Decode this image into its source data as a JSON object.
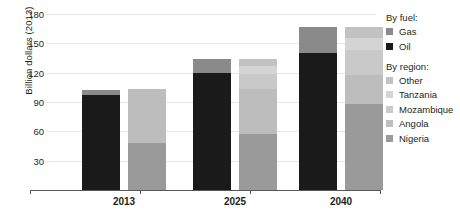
{
  "chart_data": {
    "type": "bar",
    "title": "",
    "subtitle": "",
    "xlabel": "",
    "ylabel": "Billion dollars (2013)",
    "categories": [
      "2013",
      "2025",
      "2040"
    ],
    "ylim": [
      0,
      180
    ],
    "yticks": [
      30,
      60,
      90,
      120,
      150,
      180
    ],
    "grid": true,
    "legend_position": "right",
    "stacked": true,
    "bars_per_category": 2,
    "bar_groups": [
      {
        "name": "By fuel",
        "series": [
          {
            "name": "Oil",
            "color": "#1a1a1a",
            "values": [
              97,
              120,
              140
            ]
          },
          {
            "name": "Gas",
            "color": "#8a8a8a",
            "values": [
              5,
              14,
              27
            ]
          }
        ],
        "totals": [
          102,
          134,
          167
        ]
      },
      {
        "name": "By region",
        "series": [
          {
            "name": "Nigeria",
            "color": "#9a9a9a",
            "values": [
              48,
              57,
              88
            ]
          },
          {
            "name": "Angola",
            "color": "#bdbdbd",
            "values": [
              55,
              46,
              30
            ]
          },
          {
            "name": "Mozambique",
            "color": "#c9c9c9",
            "values": [
              0,
              16,
              25
            ]
          },
          {
            "name": "Tanzania",
            "color": "#d4d4d4",
            "values": [
              0,
              8,
              13
            ]
          },
          {
            "name": "Other",
            "color": "#c2c2c2",
            "values": [
              0,
              7,
              11
            ]
          }
        ],
        "totals": [
          103,
          134,
          167
        ]
      }
    ]
  },
  "axis": {
    "y_title": "Billion dollars (2013)",
    "y_tick_labels": [
      "180",
      "150",
      "120",
      "90",
      "60",
      "30"
    ],
    "x_tick_labels": [
      "2013",
      "2025",
      "2040"
    ]
  },
  "legend": {
    "fuel_heading": "By fuel:",
    "fuel_items": [
      {
        "label": "Gas",
        "color": "#8a8a8a"
      },
      {
        "label": "Oil",
        "color": "#1a1a1a"
      }
    ],
    "region_heading": "By region:",
    "region_items": [
      {
        "label": "Other",
        "color": "#c2c2c2"
      },
      {
        "label": "Tanzania",
        "color": "#d4d4d4"
      },
      {
        "label": "Mozambique",
        "color": "#c9c9c9"
      },
      {
        "label": "Angola",
        "color": "#bdbdbd"
      },
      {
        "label": "Nigeria",
        "color": "#9a9a9a"
      }
    ]
  },
  "colors": {
    "oil": "#1a1a1a",
    "gas": "#8a8a8a",
    "nigeria": "#9a9a9a",
    "angola": "#bdbdbd",
    "mozambique": "#c9c9c9",
    "tanzania": "#d4d4d4",
    "other": "#c2c2c2",
    "grid": "#e8e8e8",
    "axis": "#58595b",
    "text": "#231f20"
  }
}
